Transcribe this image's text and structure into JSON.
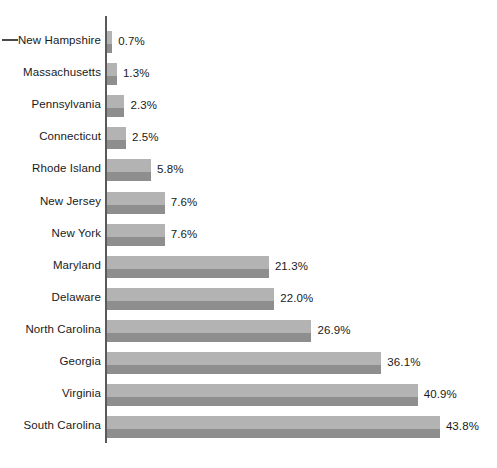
{
  "chart_data": {
    "type": "bar",
    "orientation": "horizontal",
    "title": "",
    "subtitle": "",
    "xlabel": "",
    "ylabel": "",
    "grid": false,
    "legend": null,
    "legend_position": "none",
    "value_suffix": "%",
    "xlim": [
      0,
      43.8
    ],
    "categories": [
      "New Hampshire",
      "Massachusetts",
      "Pennsylvania",
      "Connecticut",
      "Rhode Island",
      "New Jersey",
      "New York",
      "Maryland",
      "Delaware",
      "North Carolina",
      "Georgia",
      "Virginia",
      "South Carolina"
    ],
    "values": [
      0.7,
      1.3,
      2.3,
      2.5,
      5.8,
      7.6,
      7.6,
      21.3,
      22.0,
      26.9,
      36.1,
      40.9,
      43.8
    ],
    "value_labels": [
      "0.7%",
      "1.3%",
      "2.3%",
      "2.5%",
      "5.8%",
      "7.6%",
      "7.6%",
      "21.3%",
      "22.0%",
      "26.9%",
      "36.1%",
      "40.9%",
      "43.8%"
    ],
    "colors": {
      "bar_light": "#b3b3b3",
      "bar_dark": "#8e8e8e",
      "axis": "#5a5a5a",
      "text": "#1a1a1a",
      "background": "#ffffff"
    }
  }
}
